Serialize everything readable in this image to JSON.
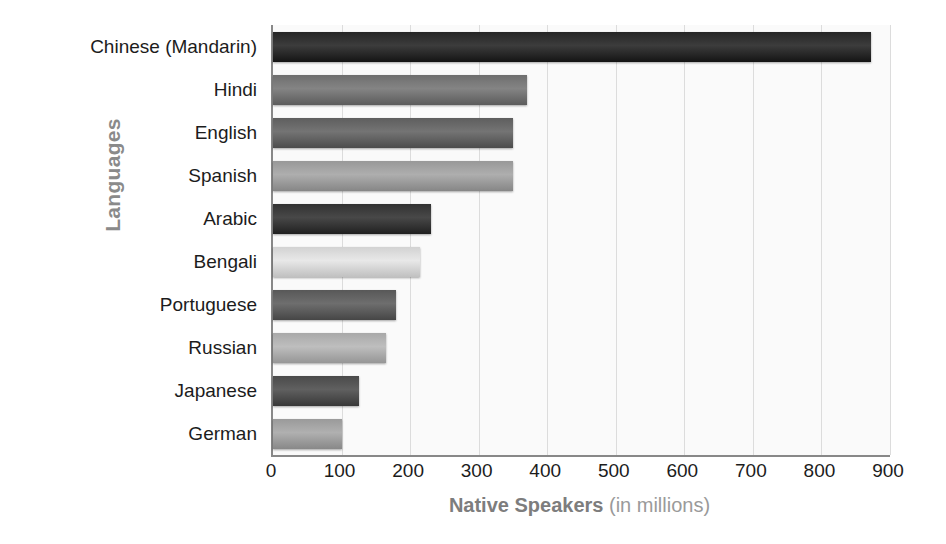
{
  "chart_data": {
    "type": "bar",
    "orientation": "horizontal",
    "title": "",
    "xlabel": "Native Speakers (in millions)",
    "xlabel_bold_part": "Native Speakers",
    "xlabel_light_part": " (in millions)",
    "ylabel": "Languages",
    "categories": [
      "Chinese (Mandarin)",
      "Hindi",
      "English",
      "Spanish",
      "Arabic",
      "Bengali",
      "Portuguese",
      "Russian",
      "Japanese",
      "German"
    ],
    "values": [
      873,
      370,
      350,
      350,
      230,
      215,
      180,
      165,
      125,
      100
    ],
    "xlim": [
      0,
      900
    ],
    "xticks": [
      0,
      100,
      200,
      300,
      400,
      500,
      600,
      700,
      800,
      900
    ],
    "xtick_labels": [
      "0",
      "100",
      "200",
      "300",
      "400",
      "500",
      "600",
      "700",
      "800",
      "900"
    ],
    "grid": true,
    "grid_axis": "x",
    "legend": false,
    "bar_colors": [
      "#262626",
      "#6e6e6e",
      "#5e5e5e",
      "#989898",
      "#323232",
      "#d2d2d2",
      "#585858",
      "#a8a8a8",
      "#4a4a4a",
      "#9a9a9a"
    ],
    "plot_background": "#fafafa",
    "gridline_color": "#dcdcdc",
    "axis_color": "#888888",
    "label_color": "#1c1c1c",
    "axis_title_color": "#8a8a8a"
  }
}
